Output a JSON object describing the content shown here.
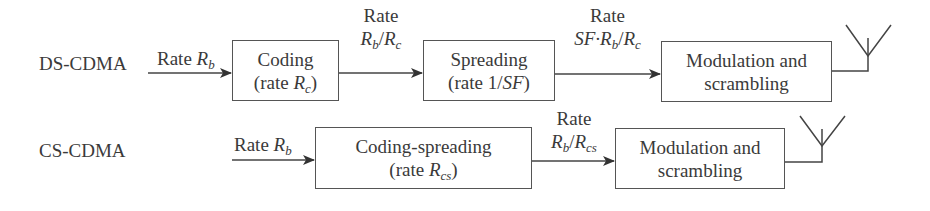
{
  "rows": [
    {
      "name": "DS-CDMA",
      "input_label": {
        "pre": "Rate ",
        "var": "R",
        "sub": "b"
      },
      "blocks": [
        {
          "line1": "Coding",
          "line2_pre": "(rate ",
          "line2_var": "R",
          "line2_sub": "c",
          "line2_post": ")"
        },
        {
          "line1": "Spreading",
          "line2_pre": "(rate 1/",
          "line2_var": "SF",
          "line2_sub": "",
          "line2_post": ")"
        },
        {
          "line1": "Modulation and",
          "line2_pre": "scrambling",
          "line2_var": "",
          "line2_sub": "",
          "line2_post": ""
        }
      ],
      "edge_labels": [
        {
          "top": "Rate",
          "bottom_pre": "",
          "v1": "R",
          "s1": "b",
          "mid": "/",
          "v2": "R",
          "s2": "c"
        },
        {
          "top": "Rate",
          "bottom_pre": "SF·",
          "v1": "R",
          "s1": "b",
          "mid": "/",
          "v2": "R",
          "s2": "c"
        }
      ]
    },
    {
      "name": "CS-CDMA",
      "input_label": {
        "pre": "Rate ",
        "var": "R",
        "sub": "b"
      },
      "blocks": [
        {
          "line1": "Coding-spreading",
          "line2_pre": "(rate ",
          "line2_var": "R",
          "line2_sub": "cs",
          "line2_post": ")"
        },
        {
          "line1": "Modulation and",
          "line2_pre": "scrambling",
          "line2_var": "",
          "line2_sub": "",
          "line2_post": ""
        }
      ],
      "edge_labels": [
        {
          "top": "Rate",
          "bottom_pre": "",
          "v1": "R",
          "s1": "b",
          "mid": "/",
          "v2": "R",
          "s2": "cs"
        }
      ]
    }
  ]
}
